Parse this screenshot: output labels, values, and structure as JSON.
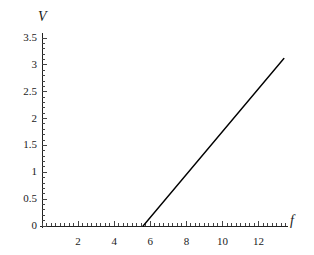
{
  "chart_data": {
    "type": "line",
    "title": "",
    "subtitle": "",
    "xlabel": "f",
    "ylabel": "V",
    "xlim": [
      0,
      13.6
    ],
    "ylim": [
      0,
      3.6
    ],
    "grid": false,
    "legend": null,
    "axis_labels": {
      "x": "f",
      "y": "V"
    },
    "xticks": [
      2,
      4,
      6,
      8,
      10,
      12
    ],
    "xtick_labels": [
      "2",
      "4",
      "6",
      "8",
      "10",
      "12"
    ],
    "xtick_minor_step": 0.25,
    "yticks": [
      0,
      0.5,
      1,
      1.5,
      2,
      2.5,
      3,
      3.5
    ],
    "ytick_labels": [
      "0",
      "0.5",
      "1",
      "1.5",
      "2",
      "2.5",
      "3",
      "3.5"
    ],
    "ytick_minor_step": 0.1,
    "series": [
      {
        "name": "V",
        "color": "#000000",
        "x": [
          5.6,
          13.4
        ],
        "values": [
          0,
          3.12
        ],
        "slope": 0.4,
        "x_intercept": 5.6,
        "points": [
          [
            5.6,
            0
          ],
          [
            13.4,
            3.12
          ]
        ]
      }
    ],
    "annotations": []
  },
  "colors": {
    "background": "#ffffff",
    "axis": "#222222",
    "tick": "#444444",
    "line": "#000000",
    "text": "#1a1a1a"
  },
  "axis_titles": {
    "y_title": "V",
    "x_title": "f"
  }
}
